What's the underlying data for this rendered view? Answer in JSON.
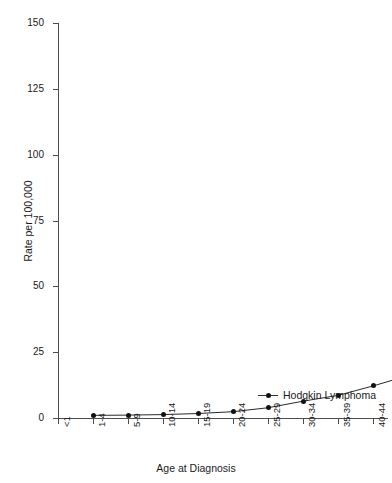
{
  "chart_data": {
    "type": "line",
    "title": "",
    "subtitle": "",
    "xlabel": "Age at Diagnosis",
    "ylabel": "Rate per 100,000",
    "categories": [
      "<1",
      "1-4",
      "5-9",
      "10-14",
      "15-19",
      "20-24",
      "25-29",
      "30-34",
      "35-39",
      "40-44",
      "45-49",
      "50-54",
      "55-59",
      "60-64",
      "65-69",
      "70-74",
      "75-79",
      "80-85",
      "85+"
    ],
    "values": [
      null,
      1.0,
      1.1,
      1.3,
      1.7,
      2.4,
      3.9,
      6.4,
      8.6,
      12.2,
      16.1,
      22.1,
      31.6,
      43.3,
      59.8,
      80.6,
      98.6,
      110.2,
      101.3
    ],
    "series": [
      {
        "name": "Hodgkin Lymphoma",
        "marker": "filled-circle",
        "color": "#111111",
        "values": [
          null,
          1.0,
          1.1,
          1.3,
          1.7,
          2.4,
          3.9,
          6.4,
          8.6,
          12.2,
          16.1,
          22.1,
          31.6,
          43.3,
          59.8,
          80.6,
          98.6,
          110.2,
          101.3
        ]
      }
    ],
    "ylim": [
      0,
      150
    ],
    "yticks": [
      0,
      25,
      50,
      75,
      100,
      125,
      150
    ],
    "ytick_labels": [
      "0",
      "25",
      "50",
      "75",
      "100",
      "125",
      "150"
    ],
    "grid": false,
    "legend_position": "inside-lower-right",
    "legend_entries": [
      "Hodgkin Lymphoma"
    ]
  },
  "axes": {
    "y_title": "Rate per 100,000",
    "x_title": "Age at Diagnosis"
  },
  "legend": {
    "items": [
      {
        "label": "Hodgkin Lymphoma",
        "marker_name": "filled-circle-marker"
      }
    ]
  }
}
